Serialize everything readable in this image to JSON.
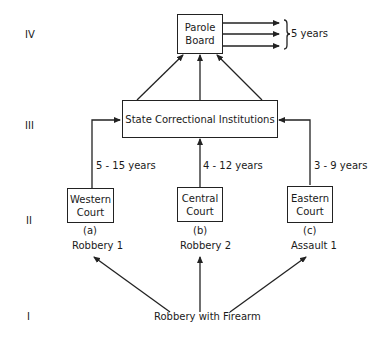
{
  "levels": {
    "iv": "IV",
    "iii": "III",
    "ii": "II",
    "i": "I"
  },
  "parole_board": {
    "line1": "Parole",
    "line2": "Board"
  },
  "parole_output": {
    "duration": "5 years",
    "arrow_count": 3
  },
  "institutions": {
    "label": "State Correctional Institutions"
  },
  "courts": [
    {
      "line1": "Western",
      "line2": "Court",
      "marker": "(a)",
      "charge": "Robbery 1",
      "sentence": "5 - 15 years"
    },
    {
      "line1": "Central",
      "line2": "Court",
      "marker": "(b)",
      "charge": "Robbery 2",
      "sentence": "4 - 12 years"
    },
    {
      "line1": "Eastern",
      "line2": "Court",
      "marker": "(c)",
      "charge": "Assault 1",
      "sentence": "3 - 9 years"
    }
  ],
  "origin": {
    "label": "Robbery with Firearm"
  },
  "colors": {
    "line": "#222222",
    "background": "#ffffff"
  }
}
